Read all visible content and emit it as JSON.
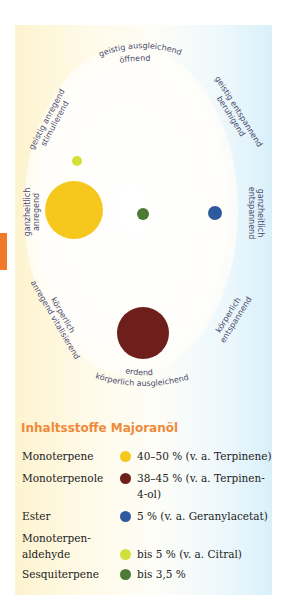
{
  "diagram": {
    "labels": {
      "top": "geistig ausgleichend",
      "top_sub": "öffnend",
      "upper_left": "geistig anregend",
      "upper_left_sub": "stimulierend",
      "upper_right": "geistig entspannend",
      "upper_right_sub": "beruhigend",
      "left": "ganzheitlich",
      "left_sub": "anregend",
      "right": "ganzheitlich",
      "right_sub": "entspannend",
      "lower_left": "körperlich",
      "lower_left_sub": "anregend vitalisierend",
      "lower_right": "körperlich",
      "lower_right_sub": "entspannend",
      "bottom": "erdend",
      "bottom_sub": "körperlich ausgleichend"
    },
    "dots": [
      {
        "name": "monoterpene",
        "color": "#f6c81e",
        "x": 74,
        "y": 210,
        "r": 29
      },
      {
        "name": "monoterpenole",
        "color": "#6e1f1c",
        "x": 143,
        "y": 333,
        "r": 26
      },
      {
        "name": "ester",
        "color": "#2d5a9e",
        "x": 215,
        "y": 213,
        "r": 7
      },
      {
        "name": "monoterpenaldehyde",
        "color": "#d2e03a",
        "x": 77,
        "y": 161,
        "r": 5
      },
      {
        "name": "sesquiterpene",
        "color": "#4d7a35",
        "x": 143,
        "y": 214,
        "r": 6
      }
    ]
  },
  "legend": {
    "title": "Inhaltsstoffe Majoranöl",
    "items": [
      {
        "name": "Monoterpene",
        "value": "40–50 % (v. a. Terpinene)",
        "value2": "",
        "color": "#f6c81e"
      },
      {
        "name": "Monoterpenole",
        "value": "38–45 % (v. a. Terpinen-",
        "value2": "4-ol)",
        "color": "#6e1f1c"
      },
      {
        "name": "Ester",
        "value": "5 % (v. a. Geranylacetat)",
        "value2": "",
        "color": "#2d5a9e"
      },
      {
        "name": "Monoterpen-",
        "name2": "aldehyde",
        "value": "bis 5 % (v. a. Citral)",
        "value2": "",
        "color": "#d2e03a"
      },
      {
        "name": "Sesquiterpene",
        "value": "bis 3,5 %",
        "value2": "",
        "color": "#4d7a35"
      }
    ]
  },
  "colors": {
    "accent_tab": "#f07a28",
    "title": "#ef8a3a",
    "label_text": "#4a4a6a"
  }
}
